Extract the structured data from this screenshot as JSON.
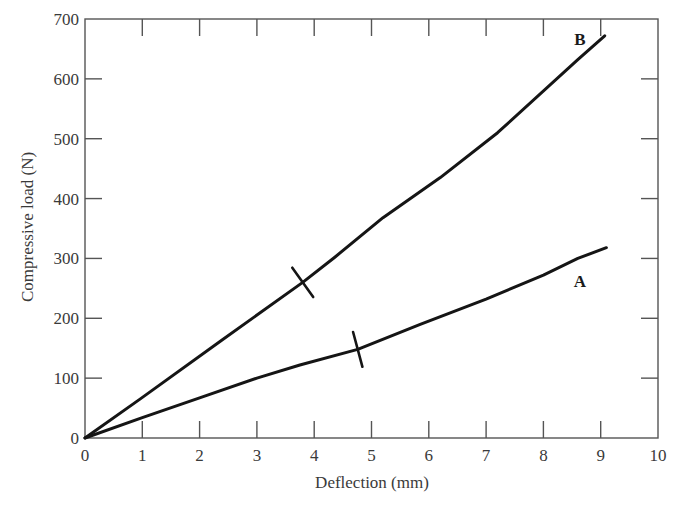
{
  "chart_data": {
    "type": "line",
    "title": "",
    "xlabel": "Deflection (mm)",
    "ylabel": "Compressive load (N)",
    "xlim": [
      0,
      10
    ],
    "ylim": [
      0,
      700
    ],
    "x_ticks": [
      0,
      1,
      2,
      3,
      4,
      5,
      6,
      7,
      8,
      9,
      10
    ],
    "y_ticks": [
      0,
      100,
      200,
      300,
      400,
      500,
      600,
      700
    ],
    "grid": false,
    "legend": "none (inline labels A and B)",
    "series": [
      {
        "name": "A",
        "x": [
          0,
          1,
          2,
          3,
          3.75,
          4.76,
          5.85,
          7,
          8,
          8.6,
          9.1
        ],
        "y": [
          0,
          34,
          67,
          100,
          122,
          148,
          190,
          232,
          272,
          300,
          318
        ],
        "marker_at": {
          "x": 4.76,
          "y": 148
        },
        "label_position": {
          "x": 8.6,
          "y": 265
        }
      },
      {
        "name": "B",
        "x": [
          0,
          0.96,
          2.41,
          3.8,
          4.36,
          5.2,
          6.2,
          7.2,
          8.6,
          9.07
        ],
        "y": [
          0,
          65,
          165,
          260,
          302,
          368,
          435,
          510,
          632,
          672
        ],
        "marker_at": {
          "x": 3.8,
          "y": 260
        },
        "label_position": {
          "x": 8.6,
          "y": 665
        }
      }
    ]
  },
  "axes": {
    "x_title": "Deflection (mm)",
    "y_title": "Compressive load (N)",
    "x_tick_labels": [
      "0",
      "1",
      "2",
      "3",
      "4",
      "5",
      "6",
      "7",
      "8",
      "9",
      "10"
    ],
    "y_tick_labels": [
      "0",
      "100",
      "200",
      "300",
      "400",
      "500",
      "600",
      "700"
    ]
  },
  "labels": {
    "series_a": "A",
    "series_b": "B"
  },
  "colors": {
    "line": "#151515",
    "frame": "#555555",
    "text": "#3a3a3a",
    "background": "#ffffff"
  }
}
